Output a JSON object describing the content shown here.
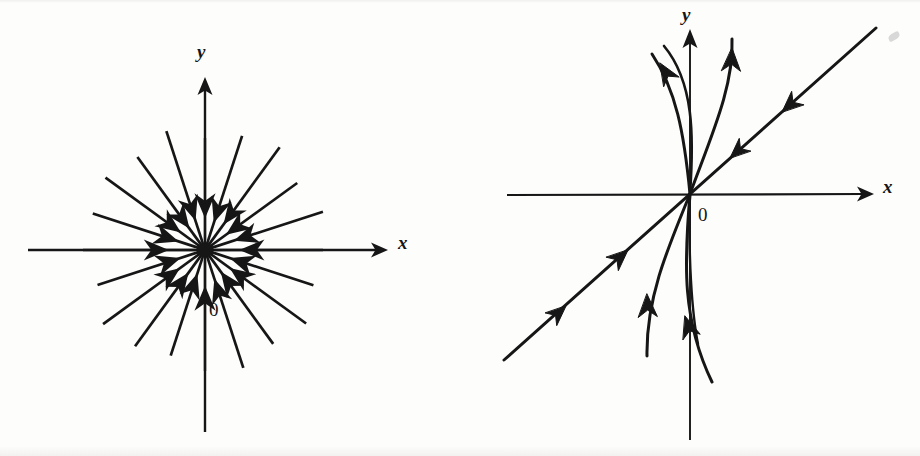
{
  "page": {
    "background_color": "#fdfdfc",
    "ink_color": "#161616",
    "width": 920,
    "height": 456
  },
  "figures": [
    {
      "id": "left",
      "name": "star-node-phase-portrait",
      "description": "Stable star node: straight-line trajectories radiating from all directions with arrows pointing inward toward the origin",
      "axes": {
        "x_label": "x",
        "y_label": "y",
        "origin_label": "0",
        "origin": {
          "x": 205,
          "y": 250
        },
        "x_axis": {
          "x_start": 28,
          "x_end": 386,
          "y": 250
        },
        "y_axis": {
          "y_top": 78,
          "y_bottom": 432,
          "x": 205
        },
        "x_label_pos": {
          "x": 398,
          "y": 248
        },
        "y_label_pos": {
          "x": 198,
          "y": 55
        },
        "origin_label_pos": {
          "x": 210,
          "y": 313
        }
      },
      "trajectory_count": 20,
      "trajectory_angles_deg": [
        0,
        18,
        36,
        54,
        72,
        90,
        108,
        126,
        144,
        162,
        180,
        198,
        216,
        234,
        252,
        270,
        288,
        306,
        324,
        342
      ],
      "trajectory_radius": 118,
      "arrow_direction": "inward"
    },
    {
      "id": "right",
      "name": "degenerate-node-phase-portrait",
      "description": "Stable degenerate (improper) node: one straight-line eigendirection plus curved trajectories tangent to it, all arrows pointing inward toward the origin",
      "axes": {
        "x_label": "x",
        "y_label": "y",
        "origin_label": "0",
        "origin": {
          "x": 230,
          "y": 194
        },
        "x_axis": {
          "x_start": 47,
          "x_end": 412,
          "y": 194
        },
        "y_axis": {
          "y_top": 30,
          "y_bottom": 440,
          "x": 230
        },
        "x_label_pos": {
          "x": 423,
          "y": 192
        },
        "y_label_pos": {
          "x": 223,
          "y": 18
        },
        "origin_label_pos": {
          "x": 238,
          "y": 218
        }
      },
      "trajectory_count": 6,
      "eigendirection_slope_deg": 45,
      "arrow_direction": "inward"
    }
  ],
  "artifacts": [
    {
      "name": "scan-smudge",
      "x": 888,
      "y": 33
    }
  ]
}
